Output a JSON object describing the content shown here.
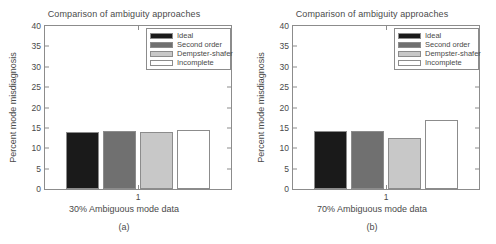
{
  "chart_data": [
    {
      "type": "bar",
      "panel": "a",
      "title": "Comparison of ambiguity approaches",
      "xlabel": "30% Ambiguous mode data",
      "ylabel": "Percent mode misdiagnosis",
      "subcaption": "(a)",
      "categories": [
        "1"
      ],
      "xtick_labels": [
        "1"
      ],
      "ylim": [
        0,
        40
      ],
      "yticks": [
        0,
        5,
        10,
        15,
        20,
        25,
        30,
        35,
        40
      ],
      "ytick_labels": [
        "0",
        "5",
        "10",
        "15",
        "20",
        "25",
        "30",
        "35",
        "40"
      ],
      "grid": false,
      "legend_position": "top-right",
      "series": [
        {
          "name": "Ideal",
          "values": [
            14.0
          ],
          "color": "#1a1a1a"
        },
        {
          "name": "Second order",
          "values": [
            14.3
          ],
          "color": "#707070"
        },
        {
          "name": "Dempster-shafer",
          "values": [
            13.9
          ],
          "color": "#c8c8c8"
        },
        {
          "name": "Incomplete",
          "values": [
            14.4
          ],
          "color": "#ffffff"
        }
      ]
    },
    {
      "type": "bar",
      "panel": "b",
      "title": "Comparison of ambiguity approaches",
      "xlabel": "70% Ambiguous mode data",
      "ylabel": "Percent mode misdiagnosis",
      "subcaption": "(b)",
      "categories": [
        "1"
      ],
      "xtick_labels": [
        "1"
      ],
      "ylim": [
        0,
        40
      ],
      "yticks": [
        0,
        5,
        10,
        15,
        20,
        25,
        30,
        35,
        40
      ],
      "ytick_labels": [
        "0",
        "5",
        "10",
        "15",
        "20",
        "25",
        "30",
        "35",
        "40"
      ],
      "grid": false,
      "legend_position": "top-right",
      "series": [
        {
          "name": "Ideal",
          "values": [
            14.2
          ],
          "color": "#1a1a1a"
        },
        {
          "name": "Second order",
          "values": [
            14.3
          ],
          "color": "#707070"
        },
        {
          "name": "Dempster-shafer",
          "values": [
            12.4
          ],
          "color": "#c8c8c8"
        },
        {
          "name": "Incomplete",
          "values": [
            17.0
          ],
          "color": "#ffffff"
        }
      ]
    }
  ],
  "style": {
    "axis_color": "#8c8c8c",
    "text_color": "#4a4a4a",
    "background": "#ffffff"
  }
}
